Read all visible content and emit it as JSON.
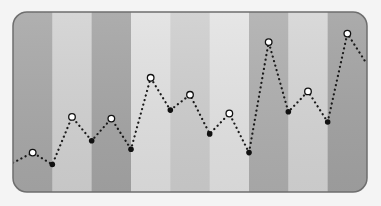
{
  "chart_data": {
    "type": "line",
    "title": "",
    "xlabel": "",
    "ylabel": "",
    "grid": false,
    "legend": "none",
    "background_stripes": [
      "#a9a9a9",
      "#d3d3d3",
      "#a6a6a6",
      "#e2e2e2",
      "#cfcfcf",
      "#e4e4e4",
      "#b0b0b0",
      "#d6d6d6",
      "#a4a4a4"
    ],
    "line_style": "dotted",
    "line_color": "#1a1a1a",
    "marker_open_color": "#ffffff",
    "marker_filled_color": "#111111",
    "x": [
      0,
      1,
      2,
      3,
      4,
      5,
      6,
      7,
      8,
      9,
      10,
      11,
      12,
      13,
      14,
      15,
      16,
      17,
      18
    ],
    "values": [
      16,
      22,
      15,
      43,
      29,
      42,
      24,
      66,
      47,
      56,
      33,
      45,
      22,
      87,
      46,
      58,
      40,
      92,
      74
    ],
    "marker_types": [
      "none",
      "open",
      "filled",
      "open",
      "filled",
      "open",
      "filled",
      "open",
      "filled",
      "open",
      "filled",
      "open",
      "filled",
      "open",
      "filled",
      "open",
      "filled",
      "open",
      "none"
    ],
    "ylim": [
      0,
      100
    ]
  },
  "panel": {
    "x": 13,
    "y": 12,
    "width": 354,
    "height": 180,
    "corner_radius": 14,
    "border_color": "#6e6e6e"
  }
}
